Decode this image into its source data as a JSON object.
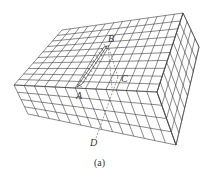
{
  "figure": {
    "caption": "(a)",
    "points": {
      "A": "A",
      "B": "B",
      "C": "C",
      "D": "D"
    },
    "colors": {
      "line": "#3a3a3a",
      "background": "#ffffff",
      "hatch": "#3a3a3a"
    },
    "grid": {
      "top_u": 14,
      "top_v": 10,
      "front_v": 4,
      "right_u": 8
    }
  }
}
